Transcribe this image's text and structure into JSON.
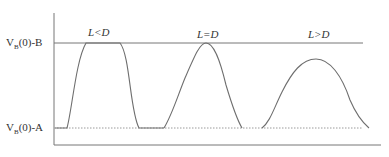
{
  "diagram": {
    "y_labels": {
      "top": {
        "main": "V",
        "sub": "B",
        "rest": "(0)-B"
      },
      "bottom": {
        "main": "V",
        "sub": "B",
        "rest": "(0)-A"
      }
    },
    "cases": [
      {
        "label": "L<D",
        "shape": "flat-top pulse"
      },
      {
        "label": "L=D",
        "shape": "peak touching B"
      },
      {
        "label": "L>D",
        "shape": "peak below B"
      }
    ],
    "colors": {
      "line": "#6e6e6e",
      "dotted": "#9a9a9a"
    }
  }
}
